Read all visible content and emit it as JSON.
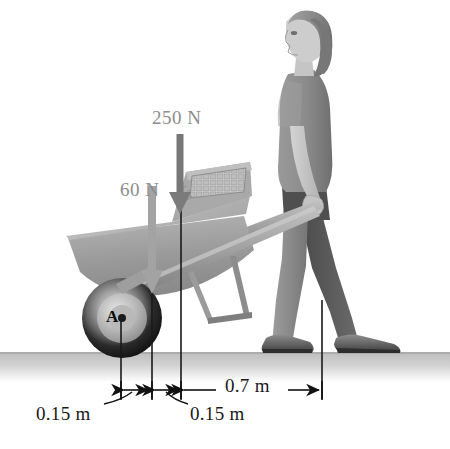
{
  "figure": {
    "background_color": "#ffffff",
    "ground_color": "#c9c9c9"
  },
  "forces": [
    {
      "id": "load-force",
      "label": "250 N",
      "color": "#8d8d8d",
      "arrow_color": "#6d6d6d",
      "direction": "down",
      "label_x": 152,
      "label_y": 112,
      "arrow_x": 180,
      "arrow_y_start": 134,
      "arrow_y_end": 212
    },
    {
      "id": "weight-force",
      "label": "60 N",
      "color": "#8d8d8d",
      "arrow_color": "#a0a0a0",
      "direction": "down",
      "label_x": 120,
      "label_y": 181,
      "arrow_x": 152,
      "arrow_y_start": 186,
      "arrow_y_end": 292
    }
  ],
  "points": [
    {
      "id": "axle-point",
      "label": "A",
      "x": 116,
      "y": 310
    }
  ],
  "dimensions": [
    {
      "id": "dim-left-015",
      "label": "0.15 m",
      "value": 0.15,
      "unit": "m",
      "from_x": 121,
      "to_x": 152,
      "label_x": 36,
      "label_y": 410
    },
    {
      "id": "dim-mid-015",
      "label": "0.15 m",
      "value": 0.15,
      "unit": "m",
      "from_x": 152,
      "to_x": 181,
      "label_x": 190,
      "label_y": 410
    },
    {
      "id": "dim-right-07",
      "label": "0.7 m",
      "value": 0.7,
      "unit": "m",
      "from_x": 181,
      "to_x": 322,
      "label_x": 225,
      "label_y": 378
    }
  ],
  "extension_lines": [
    {
      "id": "ext-axle",
      "x": 121,
      "y_top": 320,
      "y_bottom": 400
    },
    {
      "id": "ext-cg",
      "x": 152,
      "y_top": 288,
      "y_bottom": 400
    },
    {
      "id": "ext-load",
      "x": 181,
      "y_top": 208,
      "y_bottom": 400
    },
    {
      "id": "ext-hand",
      "x": 322,
      "y_top": 300,
      "y_bottom": 400
    }
  ],
  "scene_objects": [
    {
      "id": "person",
      "label": "woman pushing wheelbarrow"
    },
    {
      "id": "wheelbarrow",
      "label": "wheelbarrow with load"
    },
    {
      "id": "wheel",
      "label": "wheelbarrow wheel"
    },
    {
      "id": "ground",
      "label": "ground surface"
    }
  ]
}
